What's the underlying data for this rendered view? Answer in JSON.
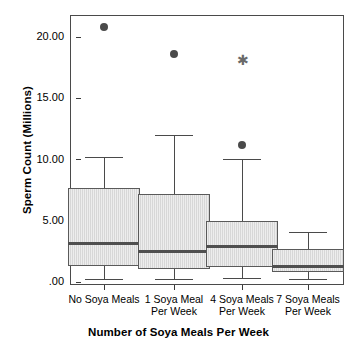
{
  "chart_data": {
    "type": "box",
    "title": "",
    "xlabel": "Number of Soya Meals Per Week",
    "ylabel": "Sperm Count (Millions)",
    "ylim": [
      0.0,
      22.0
    ],
    "grid": false,
    "legend": "none",
    "ytick_labels": [
      ".00",
      "5.00",
      "10.00",
      "15.00",
      "20.00"
    ],
    "ytick_values": [
      0.0,
      5.0,
      10.0,
      15.0,
      20.0
    ],
    "categories": [
      "No Soya Meals",
      "1 Soya Meal\nPer Week",
      "4 Soya Meals\nPer Week",
      "7 Soya Meals\nPer Week"
    ],
    "boxes": [
      {
        "category": "No Soya Meals",
        "whisker_low": 0.25,
        "q1": 1.3,
        "median": 3.15,
        "q3": 7.7,
        "whisker_high": 10.2,
        "outliers": [
          20.8
        ],
        "extremes": []
      },
      {
        "category": "1 Soya Meal Per Week",
        "whisker_low": 0.25,
        "q1": 1.1,
        "median": 2.5,
        "q3": 7.2,
        "whisker_high": 12.0,
        "outliers": [
          18.65
        ],
        "extremes": []
      },
      {
        "category": "4 Soya Meals Per Week",
        "whisker_low": 0.3,
        "q1": 1.25,
        "median": 2.9,
        "q3": 5.0,
        "whisker_high": 10.05,
        "outliers": [
          11.15
        ],
        "extremes": [
          18.05
        ]
      },
      {
        "category": "7 Soya Meals Per Week",
        "whisker_low": 0.25,
        "q1": 0.8,
        "median": 1.25,
        "q3": 2.7,
        "whisker_high": 4.1,
        "outliers": [],
        "extremes": []
      }
    ],
    "colors": {
      "box_fill": "#d7d7d7",
      "box_edge": "#5a5a5a",
      "median": "#4f4f4f",
      "whisker": "#4a4a4a",
      "outlier": "#4a4a4a",
      "extreme": "#6a6a6a",
      "frame": "#4a4a4a",
      "background": "#ffffff"
    }
  }
}
